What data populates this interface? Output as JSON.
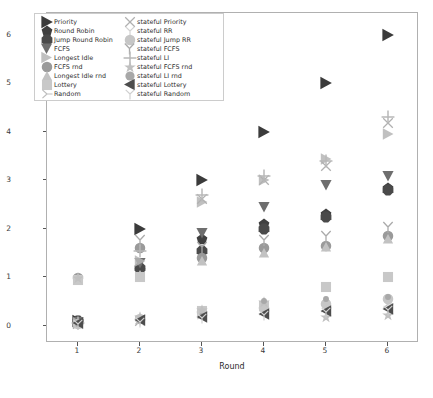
{
  "chart_data": {
    "type": "scatter",
    "title": "",
    "xlabel": "Round",
    "ylabel": "Max Leakage (bits)",
    "xlim": [
      0.5,
      6.5
    ],
    "ylim": [
      -0.35,
      6.45
    ],
    "xticks": [
      1,
      2,
      3,
      4,
      5,
      6
    ],
    "yticks": [
      0,
      1,
      2,
      3,
      4,
      5,
      6
    ],
    "grid": false,
    "legend_position": "upper left",
    "x": [
      1,
      2,
      3,
      4,
      5,
      6
    ],
    "series": [
      {
        "name": "Priority",
        "marker": "right-triangle",
        "color": "#3b3b3b",
        "size": 7,
        "values": [
          0.1,
          2.0,
          3.0,
          4.0,
          5.0,
          6.0
        ]
      },
      {
        "name": "Round Robin",
        "marker": "pentagon",
        "color": "#404040",
        "size": 6,
        "values": [
          0.1,
          1.15,
          1.8,
          2.1,
          2.3,
          2.85
        ]
      },
      {
        "name": "Jump Round Robin",
        "marker": "octagon",
        "color": "#4a4a4a",
        "size": 6,
        "values": [
          0.1,
          1.2,
          1.55,
          2.0,
          2.25,
          2.8
        ]
      },
      {
        "name": "FCFS",
        "marker": "down-triangle",
        "color": "#6e6e6e",
        "size": 6.5,
        "values": [
          0.08,
          1.3,
          1.92,
          2.45,
          2.9,
          3.1
        ]
      },
      {
        "name": "Longest Idle",
        "marker": "right-triangle-open",
        "color": "#b5b5b5",
        "size": 6.5,
        "values": [
          0.07,
          1.35,
          2.55,
          3.0,
          3.45,
          3.95
        ]
      },
      {
        "name": "FCFS rnd",
        "marker": "circle",
        "color": "#9a9a9a",
        "size": 6,
        "values": [
          0.98,
          1.6,
          1.4,
          1.6,
          1.65,
          1.85
        ]
      },
      {
        "name": "Longest Idle rnd",
        "marker": "up-triangle-light",
        "color": "#c2c2c2",
        "size": 6,
        "values": [
          0.95,
          1.05,
          1.35,
          1.5,
          1.62,
          1.8
        ]
      },
      {
        "name": "Lottery",
        "marker": "square-light",
        "color": "#c8c8c8",
        "size": 6,
        "values": [
          0.95,
          1.0,
          0.3,
          0.42,
          0.8,
          1.0
        ]
      },
      {
        "name": "Random",
        "marker": "tri-right",
        "color": "#bdbdbd",
        "size": 6,
        "values": [
          0.05,
          0.12,
          0.22,
          0.3,
          0.38,
          0.45
        ]
      },
      {
        "name": "stateful Priority",
        "marker": "x-thin",
        "color": "#b0b0b0",
        "size": 6,
        "values": [
          0.05,
          0.1,
          2.62,
          3.0,
          3.3,
          4.18
        ]
      },
      {
        "name": "stateful RR",
        "marker": "tri-down-light",
        "color": "#d2d2d2",
        "size": 6,
        "values": [
          0.05,
          0.12,
          0.25,
          0.35,
          0.42,
          0.52
        ]
      },
      {
        "name": "stateful Jump RR",
        "marker": "circle-light",
        "color": "#c6c6c6",
        "size": 6,
        "values": [
          0.05,
          0.14,
          0.28,
          0.38,
          0.45,
          0.55
        ]
      },
      {
        "name": "stateful FCFS",
        "marker": "tri-up-y",
        "color": "#aaaaaa",
        "size": 6.5,
        "values": [
          0.06,
          1.78,
          1.62,
          1.78,
          1.85,
          2.05
        ]
      },
      {
        "name": "stateful LI",
        "marker": "plus",
        "color": "#b8b8b8",
        "size": 7,
        "values": [
          0.06,
          1.55,
          2.7,
          3.1,
          3.4,
          4.3
        ]
      },
      {
        "name": "stateful FCFS rnd",
        "marker": "star",
        "color": "#c0c0c0",
        "size": 6,
        "values": [
          0.98,
          0.18,
          0.32,
          0.5,
          0.18,
          0.22
        ]
      },
      {
        "name": "stateful LI rnd",
        "marker": "dot-small",
        "color": "#a8a8a8",
        "size": 3.2,
        "values": [
          0.04,
          0.1,
          0.2,
          0.52,
          0.55,
          0.6
        ]
      },
      {
        "name": "stateful Lottery",
        "marker": "left-triangle",
        "color": "#4d4d4d",
        "size": 6.5,
        "values": [
          0.06,
          0.12,
          0.18,
          0.25,
          0.3,
          0.35
        ]
      },
      {
        "name": "stateful Random",
        "marker": "tri-down-open",
        "color": "#cfcfcf",
        "size": 6,
        "values": [
          0.04,
          0.09,
          0.16,
          0.22,
          0.28,
          0.33
        ]
      }
    ]
  },
  "axis": {
    "xlabel": "Round",
    "ylabel": "Max Leakage (bits)",
    "xticks": [
      "1",
      "2",
      "3",
      "4",
      "5",
      "6"
    ],
    "yticks": [
      "0",
      "1",
      "2",
      "3",
      "4",
      "5",
      "6"
    ]
  },
  "legend": {
    "column1": [
      {
        "label": "Priority"
      },
      {
        "label": "Round Robin"
      },
      {
        "label": "Jump Round Robin"
      },
      {
        "label": "FCFS"
      },
      {
        "label": "Longest Idle"
      },
      {
        "label": "FCFS rnd"
      },
      {
        "label": "Longest Idle rnd"
      },
      {
        "label": "Lottery"
      },
      {
        "label": "Random"
      }
    ],
    "column2": [
      {
        "label": "stateful Priority"
      },
      {
        "label": "stateful RR"
      },
      {
        "label": "stateful Jump RR"
      },
      {
        "label": "stateful FCFS"
      },
      {
        "label": "stateful LI"
      },
      {
        "label": "stateful FCFS rnd"
      },
      {
        "label": "stateful LI rnd"
      },
      {
        "label": "stateful Lottery"
      },
      {
        "label": "stateful Random"
      }
    ]
  }
}
